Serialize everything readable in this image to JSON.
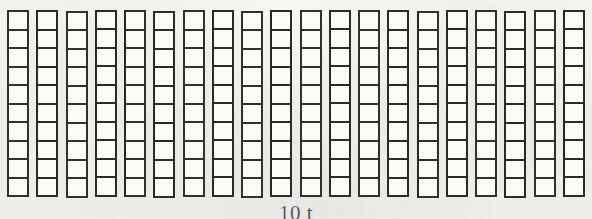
{
  "diagram": {
    "caption": "10 t",
    "caption_note": "clipped-at-image-edge",
    "background_color": "#f4f4f2",
    "line_color": "#2e2e2e",
    "cell_fill_color": "#fbfbfa"
  },
  "chart_data": {
    "type": "bar",
    "title": "10 t",
    "xlabel": "",
    "ylabel": "",
    "categories": [
      "rod-1",
      "rod-2",
      "rod-3",
      "rod-4",
      "rod-5",
      "rod-6",
      "rod-7",
      "rod-8",
      "rod-9",
      "rod-10",
      "rod-11",
      "rod-12",
      "rod-13",
      "rod-14",
      "rod-15",
      "rod-16",
      "rod-17",
      "rod-18",
      "rod-19",
      "rod-20"
    ],
    "values": [
      10,
      10,
      10,
      10,
      10,
      10,
      10,
      10,
      10,
      10,
      10,
      10,
      10,
      10,
      10,
      10,
      10,
      10,
      10,
      10
    ],
    "ylim": [
      0,
      10
    ],
    "grid": true,
    "legend": false,
    "rod_count": 20,
    "cells_per_rod": 10,
    "total_units": 200
  }
}
